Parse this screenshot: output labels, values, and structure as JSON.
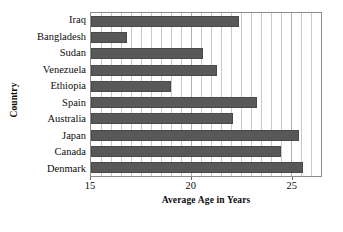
{
  "chart_data": {
    "type": "bar",
    "orientation": "horizontal",
    "title": "",
    "xlabel": "Average Age in Years",
    "ylabel": "Country",
    "categories": [
      "Iraq",
      "Bangladesh",
      "Sudan",
      "Venezuela",
      "Ethiopia",
      "Spain",
      "Australia",
      "Japan",
      "Canada",
      "Denmark"
    ],
    "values": [
      22.4,
      16.8,
      20.6,
      21.3,
      19.0,
      23.3,
      22.1,
      25.4,
      24.5,
      25.6
    ],
    "xlim": [
      15,
      26.5
    ],
    "ylim": null,
    "xticks": [
      15,
      20,
      25
    ],
    "xticklabels": [
      "15",
      "20",
      "25"
    ],
    "grid": true,
    "grid_axis": "x",
    "grid_minor_step": 0.5,
    "legend": null,
    "bar_color": "#585858",
    "grid_color": "#c9c9c9",
    "axis_color": "#8d8d8d",
    "background": "#ffffff"
  }
}
